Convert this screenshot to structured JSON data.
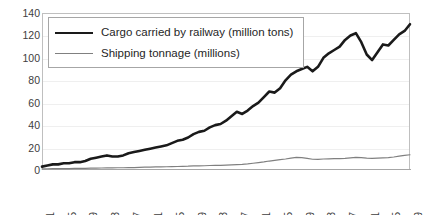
{
  "chart_data": {
    "type": "line",
    "title": "",
    "xlabel": "",
    "ylabel": "",
    "ylim": [
      0,
      140
    ],
    "ytick_step": 20,
    "yticks": [
      "140",
      "120",
      "100",
      "80",
      "60",
      "40",
      "20",
      "0"
    ],
    "grid": true,
    "legend_position": "top-left-inside",
    "xlim": [
      1871,
      1939
    ],
    "xticks": [
      "1871",
      "1875",
      "1879",
      "1883",
      "1887",
      "1891",
      "1895",
      "1899",
      "1903",
      "1907",
      "1911",
      "1915",
      "1919",
      "1923",
      "1927",
      "1931",
      "1935",
      "1939"
    ],
    "x": [
      1871,
      1872,
      1873,
      1874,
      1875,
      1876,
      1877,
      1878,
      1879,
      1880,
      1881,
      1882,
      1883,
      1884,
      1885,
      1886,
      1887,
      1888,
      1889,
      1890,
      1891,
      1892,
      1893,
      1894,
      1895,
      1896,
      1897,
      1898,
      1899,
      1900,
      1901,
      1902,
      1903,
      1904,
      1905,
      1906,
      1907,
      1908,
      1909,
      1910,
      1911,
      1912,
      1913,
      1914,
      1915,
      1916,
      1917,
      1918,
      1919,
      1920,
      1921,
      1922,
      1923,
      1924,
      1925,
      1926,
      1927,
      1928,
      1929,
      1930,
      1931,
      1932,
      1933,
      1934,
      1935,
      1936,
      1937,
      1938,
      1939
    ],
    "series": [
      {
        "name": "Cargo carried by railway (million tons)",
        "color": "#1a1a1a",
        "width": 2.6,
        "values": [
          3,
          4,
          5,
          5,
          6,
          6,
          7,
          7,
          8,
          10,
          11,
          12,
          13,
          12,
          12,
          13,
          15,
          16,
          17,
          18,
          19,
          20,
          21,
          22,
          24,
          26,
          27,
          29,
          32,
          34,
          35,
          38,
          40,
          41,
          44,
          48,
          52,
          50,
          53,
          57,
          60,
          65,
          70,
          69,
          73,
          80,
          85,
          88,
          90,
          92,
          88,
          92,
          100,
          104,
          107,
          110,
          116,
          120,
          122,
          114,
          103,
          98,
          105,
          112,
          111,
          116,
          121,
          124,
          130
        ]
      },
      {
        "name": "Shipping tonnage (millions)",
        "color": "#808080",
        "width": 1.2,
        "values": [
          1.0,
          1.1,
          1.2,
          1.2,
          1.3,
          1.3,
          1.4,
          1.4,
          1.5,
          1.6,
          1.7,
          1.8,
          1.9,
          1.9,
          2.0,
          2.0,
          2.1,
          2.2,
          2.4,
          2.5,
          2.6,
          2.7,
          2.8,
          2.9,
          3.0,
          3.1,
          3.3,
          3.4,
          3.6,
          3.7,
          3.8,
          4.0,
          4.1,
          4.2,
          4.4,
          4.6,
          4.8,
          5.0,
          5.4,
          6.0,
          6.6,
          7.2,
          8.0,
          8.6,
          9.2,
          9.8,
          10.6,
          11.2,
          11.0,
          10.4,
          9.6,
          9.4,
          9.8,
          10.0,
          10.2,
          10.2,
          10.4,
          10.8,
          11.2,
          11.0,
          10.6,
          10.4,
          10.6,
          10.8,
          11.0,
          11.6,
          12.4,
          13.0,
          13.6
        ]
      }
    ]
  },
  "legend": {
    "items": [
      {
        "label": "Cargo carried by railway (million tons)"
      },
      {
        "label": "Shipping tonnage (millions)"
      }
    ]
  }
}
